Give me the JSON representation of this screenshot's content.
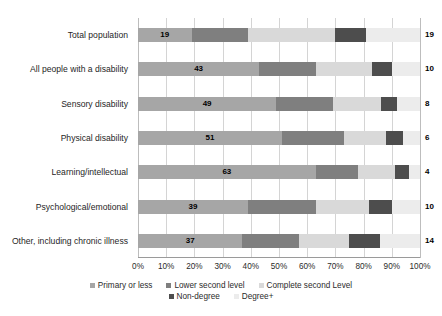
{
  "chart_data": {
    "type": "bar",
    "orientation": "horizontal",
    "stacked": true,
    "stack_mode": "percent",
    "title": "",
    "subtitle": "",
    "xlabel": "",
    "ylabel": "",
    "xlim": [
      0,
      100
    ],
    "grid": true,
    "legend_position": "bottom",
    "xticks": [
      "0%",
      "10%",
      "20%",
      "30%",
      "40%",
      "50%",
      "60%",
      "70%",
      "80%",
      "90%",
      "100%"
    ],
    "xtick_values": [
      0,
      10,
      20,
      30,
      40,
      50,
      60,
      70,
      80,
      90,
      100
    ],
    "categories": [
      "Total population",
      "All people with a disability",
      "Sensory disability",
      "Physical disability",
      "Learning/intellectual",
      "Psychological/emotional",
      "Other, including chronic illness"
    ],
    "series": [
      {
        "name": "Primary or less",
        "color": "#a6a6a6",
        "values": [
          19,
          43,
          49,
          51,
          63,
          39,
          37
        ],
        "labeled": true
      },
      {
        "name": "Lower second level",
        "color": "#7f7f7f",
        "values": [
          20,
          20,
          20,
          22,
          15,
          24,
          20
        ],
        "labeled": false
      },
      {
        "name": "Complete second Level",
        "color": "#d9d9d9",
        "values": [
          31,
          20,
          17,
          15,
          13,
          19,
          18
        ],
        "labeled": false
      },
      {
        "name": "Non-degree",
        "color": "#4d4d4d",
        "values": [
          11,
          7,
          6,
          6,
          5,
          8,
          11
        ],
        "labeled": false
      },
      {
        "name": "Degree+",
        "color": "#ececec",
        "values": [
          19,
          10,
          8,
          6,
          4,
          10,
          14
        ],
        "labeled": true
      }
    ]
  },
  "legend": {
    "rows": [
      [
        "Primary or less",
        "Lower second level",
        "Complete second Level"
      ],
      [
        "Non-degree",
        "Degree+"
      ]
    ]
  }
}
